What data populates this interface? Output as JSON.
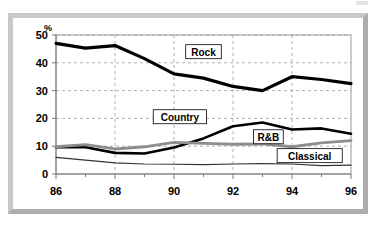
{
  "figure": {
    "unit_label": "%"
  },
  "chart_data": {
    "type": "line",
    "title": "",
    "subtitle": "",
    "xlabel": "",
    "ylabel": "%",
    "x": [
      86,
      87,
      88,
      89,
      90,
      91,
      92,
      93,
      94,
      95,
      96
    ],
    "x_tick_labels": [
      "86",
      "88",
      "90",
      "92",
      "94",
      "96"
    ],
    "x_major_ticks": [
      86,
      88,
      90,
      92,
      94,
      96
    ],
    "x_minor_ticks": [
      87,
      89,
      91,
      93,
      95
    ],
    "xlim": [
      86,
      96
    ],
    "y_tick_labels": [
      "0",
      "10",
      "20",
      "30",
      "40",
      "50"
    ],
    "y_ticks": [
      0,
      10,
      20,
      30,
      40,
      50
    ],
    "ylim": [
      0,
      50
    ],
    "grid": "both-dashed",
    "legend_position": "inline-boxed-labels",
    "series": [
      {
        "name": "Rock",
        "color": "#000000",
        "width": 3.2,
        "label_x": 91.0,
        "label_y": 44.0,
        "values": [
          47,
          45.3,
          46.2,
          41.5,
          36.0,
          34.5,
          31.5,
          30.0,
          35.0,
          34.0,
          32.5
        ]
      },
      {
        "name": "Country",
        "color": "#000000",
        "width": 2.6,
        "label_x": 90.2,
        "label_y": 20.6,
        "values": [
          9.6,
          9.6,
          7.6,
          7.4,
          9.5,
          12.8,
          17.2,
          18.5,
          16.0,
          16.4,
          14.5
        ]
      },
      {
        "name": "R&B",
        "color": "#8d8d8d",
        "width": 2.8,
        "label_x": 93.2,
        "label_y": 13.4,
        "values": [
          9.8,
          10.6,
          9.0,
          9.8,
          11.4,
          11.0,
          10.7,
          10.8,
          9.8,
          11.2,
          12.0
        ]
      },
      {
        "name": "Classical",
        "color": "#333333",
        "width": 1.2,
        "label_x": 94.6,
        "label_y": 6.6,
        "values": [
          6.0,
          5.0,
          4.0,
          3.6,
          3.5,
          3.4,
          3.6,
          3.7,
          3.6,
          3.0,
          3.2
        ]
      }
    ]
  }
}
